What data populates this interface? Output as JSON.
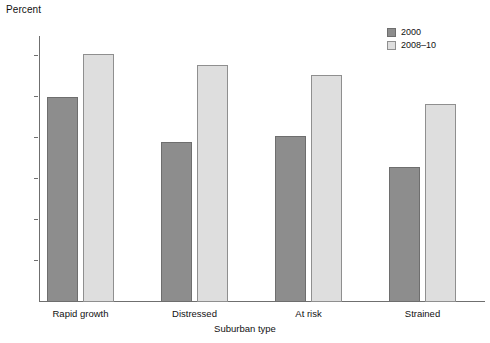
{
  "chart_data": {
    "type": "bar",
    "title": "",
    "ylabel": "Percent",
    "xlabel": "Suburban type",
    "categories": [
      "Rapid growth",
      "Distressed",
      "At risk",
      "Strained"
    ],
    "series": [
      {
        "name": "2000",
        "color": "#8d8d8d",
        "values": [
          10.0,
          7.8,
          8.1,
          6.6
        ]
      },
      {
        "name": "2008–10",
        "color": "#dedede",
        "values": [
          12.1,
          11.6,
          11.1,
          9.7
        ]
      }
    ],
    "ylim": [
      0,
      13
    ],
    "yticks": [
      2,
      4,
      6,
      8,
      10,
      12
    ],
    "ytick_labels": [
      "2",
      "4",
      "6",
      "8",
      "10",
      "12"
    ],
    "grid": false,
    "legend_position": "top-right"
  },
  "legend": {
    "entries": [
      {
        "label": "2000"
      },
      {
        "label": "2008–10"
      }
    ]
  }
}
